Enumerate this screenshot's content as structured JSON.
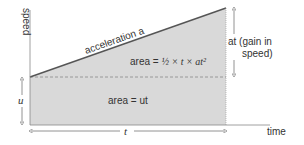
{
  "diagram": {
    "y_axis_label": "speed",
    "x_axis_label": "time",
    "slope_label": "acceleration a",
    "triangle_area_prefix": "area = ",
    "triangle_area_formula": "½ × t × at²",
    "rectangle_area_label": "area = ut",
    "initial_speed_label": "u",
    "speed_gain_label_line1": "at (gain in",
    "speed_gain_label_line2": "speed)",
    "time_interval_label": "t",
    "colors": {
      "fill": "#d9d9d9",
      "line": "#555555",
      "axis": "#888888",
      "text": "#333333"
    }
  }
}
